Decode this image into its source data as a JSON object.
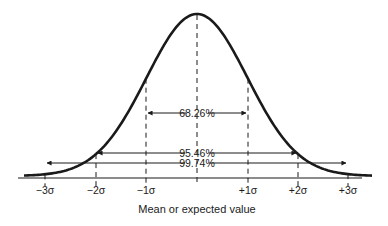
{
  "diagram": {
    "caption": "Mean or expected value",
    "colors": {
      "ink": "#1a1a1a",
      "background": "#ffffff"
    },
    "ticks": [
      "−3σ",
      "−2σ",
      "−1σ",
      "+1σ",
      "+2σ",
      "+3σ"
    ],
    "ranges": [
      {
        "label": "68.26%",
        "from": "−1σ",
        "to": "+1σ"
      },
      {
        "label": "95.46%",
        "from": "−2σ",
        "to": "+2σ"
      },
      {
        "label": "99.74%",
        "from": "−3σ",
        "to": "+3σ"
      }
    ]
  }
}
